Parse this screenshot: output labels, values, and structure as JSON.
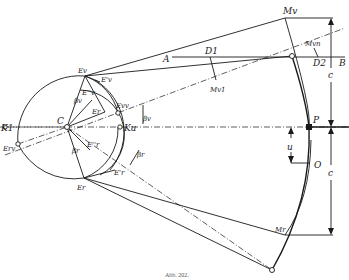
{
  "figure": {
    "caption": "Abb. 202.",
    "labels": {
      "Mv": "Mv",
      "Mvn": "Mvn",
      "Mv1": "Mv1",
      "Mr": "Mr",
      "A": "A",
      "B": "B",
      "D1": "D1",
      "D2": "D2",
      "Ev": "Ev",
      "Ev_prime": "E'v",
      "Ev_dprime": "E''v",
      "Evv": "Evv",
      "Er": "Er",
      "Er_prime": "E'r",
      "Er_dprime": "E''r",
      "Erv": "Erv",
      "K1": "K1",
      "Ku": "Ku",
      "C": "C",
      "P": "P",
      "O": "O",
      "u": "u",
      "c_top": "c",
      "c_bottom": "c",
      "beta_v": "βv",
      "beta_r": "βr",
      "beta_v_inner": "βv",
      "beta_r_inner": "βr"
    }
  }
}
